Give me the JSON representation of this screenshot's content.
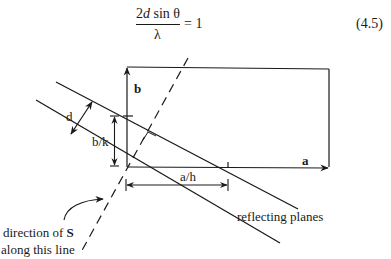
{
  "equation": {
    "numerator_prefix": "2",
    "numerator_var": "d",
    "numerator_suffix": " sin θ",
    "denominator": "λ",
    "rhs": "= 1",
    "number": "(4.5)"
  },
  "labels": {
    "b_vector": "b",
    "a_vector": "a",
    "d_spacing": "d",
    "b_over_k": "b/k",
    "a_over_h": "a/h",
    "reflecting_planes": "reflecting planes",
    "direction_line1_prefix": "direction of ",
    "direction_line1_bold": "S",
    "direction_line2": "along this line"
  },
  "colors": {
    "ink": "#1a1a1a",
    "background": "#ffffff"
  }
}
